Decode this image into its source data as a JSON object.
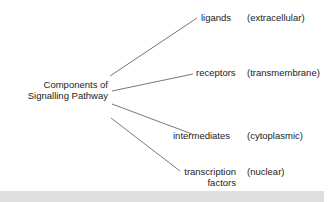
{
  "diagram": {
    "root": {
      "line1": "Components of",
      "line2": "Signalling Pathway"
    },
    "branches": [
      {
        "label": "ligands",
        "location": "(extracellular)"
      },
      {
        "label": "receptors",
        "location": "(transmembrane)"
      },
      {
        "label": "intermediates",
        "location": "(cytoplasmic)"
      },
      {
        "label_line1": "transcription",
        "label_line2": "factors",
        "location": "(nuclear)"
      }
    ],
    "line_color": "#555555"
  }
}
